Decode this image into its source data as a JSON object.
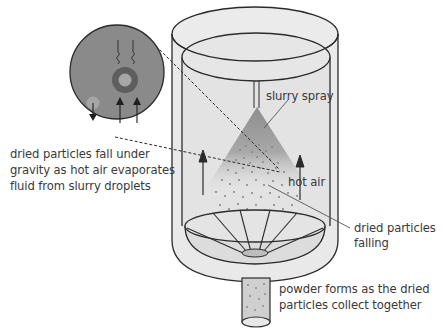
{
  "diagram": {
    "labels": {
      "slurry_spray": "slurry spray",
      "hot_air": "hot air",
      "dried_particles_falling_line1": "dried particles",
      "dried_particles_falling_line2": "falling",
      "inset_caption_line1": "dried particles fall under",
      "inset_caption_line2": "gravity as hot air evaporates",
      "inset_caption_line3": "fluid from slurry droplets",
      "powder_line1": "powder forms as the dried",
      "powder_line2": "particles collect together"
    },
    "components": [
      "outer-cylinder",
      "inner-chamber",
      "spray-nozzle",
      "spray-cone",
      "hot-air-arrows",
      "collection-funnel",
      "powder-outlet-pipe",
      "magnified-droplet-inset"
    ],
    "colors": {
      "chamber_fill": "#e6e6e6",
      "outline": "#2b2b2b",
      "inset_fill": "#8a8a8a",
      "droplet_ring": "#5e5e5e",
      "particle": "#8c8c8c",
      "spray_cone": "#9a9a9a",
      "text": "#3a3a3a"
    }
  }
}
